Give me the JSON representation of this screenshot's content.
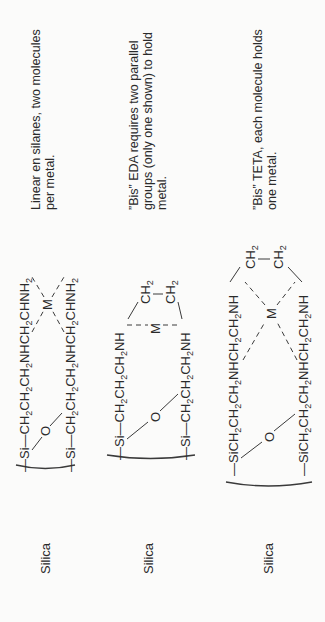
{
  "diagram": {
    "orientation": "rotated-90-ccw",
    "rows": [
      {
        "substrate_label": "Silica",
        "bridge_atom": "O",
        "metal": "M",
        "chain_top": [
          "—Si—CH",
          "2",
          "CH",
          "2",
          "CH",
          "2",
          "NHCH",
          "2",
          "CHNH",
          "2"
        ],
        "chain_bottom": [
          "—Si—CH",
          "2",
          "CH",
          "2",
          "CH",
          "2",
          "NHCH",
          "2",
          "CHNH",
          "2"
        ],
        "caption_lines": [
          "Linear en silanes, two molecules",
          "per metal."
        ]
      },
      {
        "substrate_label": "Silica",
        "bridge_atom": "O",
        "metal": "M",
        "chain_top": [
          "—Si—CH",
          "2",
          "CH",
          "2",
          "CH",
          "2",
          "NH"
        ],
        "chain_bottom": [
          "—Si—CH",
          "2",
          "CH",
          "2",
          "CH",
          "2",
          "NH"
        ],
        "bridge_groups": [
          "CH",
          "2"
        ],
        "caption_lines": [
          "”Bis” EDA requires two parallel",
          "groups (only one shown) to hold",
          "metal."
        ]
      },
      {
        "substrate_label": "Silica",
        "bridge_atom": "O",
        "metal": "M",
        "chain_top": [
          "—SiCH",
          "2",
          "CH",
          "2",
          "CH",
          "2",
          "NHCH",
          "2",
          "CH",
          "2",
          "NH"
        ],
        "chain_bottom": [
          "—SiCH",
          "2",
          "CH",
          "2",
          "CH",
          "2",
          "NHCH",
          "2",
          "CH",
          "2",
          "NH"
        ],
        "bridge_groups": [
          "CH",
          "2"
        ],
        "caption_lines": [
          "”Bis” TETA, each molecule holds",
          "one metal."
        ]
      }
    ]
  }
}
